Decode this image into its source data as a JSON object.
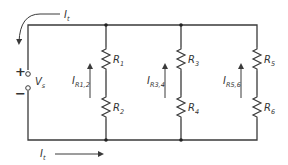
{
  "diagram": {
    "type": "parallel circuit with three series branches",
    "source": {
      "label": "V",
      "subscript": "s",
      "plus": "+",
      "minus": "−"
    },
    "total_current_top": {
      "label": "I",
      "subscript": "t"
    },
    "total_current_bottom": {
      "label": "I",
      "subscript": "t"
    },
    "branches": [
      {
        "current": {
          "label": "I",
          "subscript": "R1,2"
        },
        "resistors": [
          {
            "label": "R",
            "subscript": "1"
          },
          {
            "label": "R",
            "subscript": "2"
          }
        ]
      },
      {
        "current": {
          "label": "I",
          "subscript": "R3,4"
        },
        "resistors": [
          {
            "label": "R",
            "subscript": "3"
          },
          {
            "label": "R",
            "subscript": "4"
          }
        ]
      },
      {
        "current": {
          "label": "I",
          "subscript": "R5,6"
        },
        "resistors": [
          {
            "label": "R",
            "subscript": "5"
          },
          {
            "label": "R",
            "subscript": "6"
          }
        ]
      }
    ],
    "colors": {
      "line": "#3a3a3a",
      "background": "#ffffff"
    }
  }
}
